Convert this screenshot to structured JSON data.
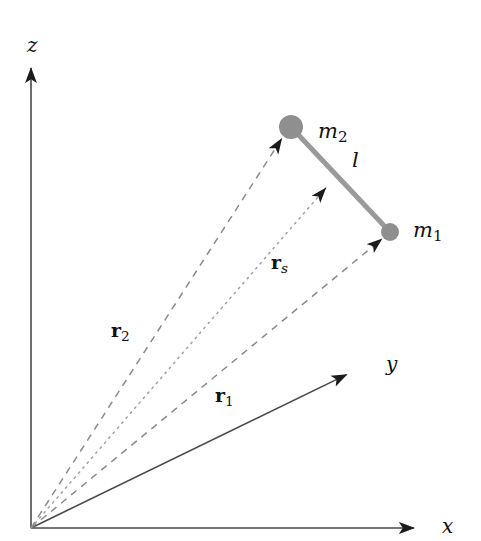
{
  "figure": {
    "background_color": "#ffffff",
    "width": 481,
    "height": 541
  },
  "axes": {
    "origin": {
      "x": 31,
      "y": 528
    },
    "color": "#4a4a4a",
    "items": [
      {
        "name": "z",
        "label": "z",
        "label_x": 27,
        "label_y": 35,
        "tip_x": 31,
        "tip_y": 62
      },
      {
        "name": "y",
        "label": "y",
        "label_x": 386,
        "label_y": 354,
        "tip_x": 352,
        "tip_y": 372
      },
      {
        "name": "x",
        "label": "x",
        "label_x": 442,
        "label_y": 516,
        "tip_x": 420,
        "tip_y": 528
      }
    ]
  },
  "masses": [
    {
      "id": "m1",
      "label": "m",
      "subscript": "1",
      "cx": 390,
      "cy": 232,
      "r": 9,
      "color": "#8f8f8f",
      "label_x": 413,
      "label_y": 220
    },
    {
      "id": "m2",
      "label": "m",
      "subscript": "2",
      "cx": 291,
      "cy": 127,
      "r": 12,
      "color": "#8f8f8f",
      "label_x": 318,
      "label_y": 121
    }
  ],
  "rod": {
    "id": "l",
    "label": "l",
    "color": "#9a9a9a",
    "width": 5,
    "x1": 291,
    "y1": 127,
    "x2": 390,
    "y2": 232,
    "label_x": 352,
    "label_y": 150
  },
  "vectors": [
    {
      "id": "r1",
      "label": "r",
      "subscript": "1",
      "style": "dashed",
      "color": "#8a8a8a",
      "from_x": 31,
      "from_y": 528,
      "to_x": 388,
      "to_y": 234,
      "label_x": 215,
      "label_y": 386
    },
    {
      "id": "r2",
      "label": "r",
      "subscript": "2",
      "style": "dashed",
      "color": "#8a8a8a",
      "from_x": 31,
      "from_y": 528,
      "to_x": 286,
      "to_y": 132,
      "label_x": 111,
      "label_y": 321
    },
    {
      "id": "rs",
      "label": "r",
      "subscript": "s",
      "style": "dotted",
      "color": "#a0a0a0",
      "from_x": 31,
      "from_y": 528,
      "to_x": 331,
      "to_y": 182,
      "label_x": 271,
      "label_y": 253
    }
  ]
}
